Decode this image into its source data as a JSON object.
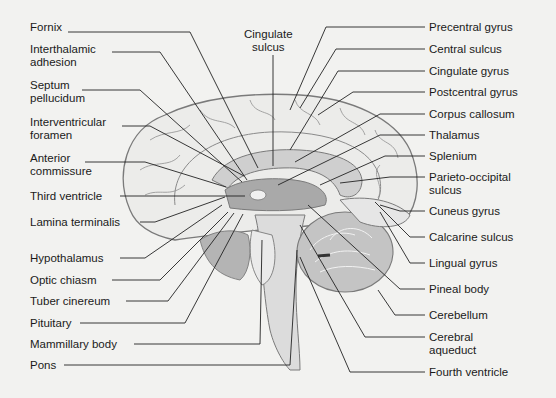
{
  "labels_left": [
    {
      "id": "fornix",
      "text": "Fornix",
      "x": 30,
      "y": 27
    },
    {
      "id": "interthalamic-adhesion",
      "text": "Interthalamic\nadhesion",
      "x": 30,
      "y": 49
    },
    {
      "id": "septum-pellucidum",
      "text": "Septum\npellucidum",
      "x": 30,
      "y": 85
    },
    {
      "id": "interventricular-foramen",
      "text": "Interventricular\nforamen",
      "x": 30,
      "y": 122
    },
    {
      "id": "anterior-commissure",
      "text": "Anterior\ncommissure",
      "x": 30,
      "y": 158
    },
    {
      "id": "third-ventricle",
      "text": "Third ventricle",
      "x": 30,
      "y": 191
    },
    {
      "id": "lamina-terminalis",
      "text": "Lamina terminalis",
      "x": 30,
      "y": 216
    },
    {
      "id": "hypothalamus",
      "text": "Hypothalamus",
      "x": 30,
      "y": 253
    },
    {
      "id": "optic-chiasm",
      "text": "Optic chiasm",
      "x": 30,
      "y": 274
    },
    {
      "id": "tuber-cinereum",
      "text": "Tuber cinereum",
      "x": 30,
      "y": 295
    },
    {
      "id": "pituitary",
      "text": "Pituitary",
      "x": 30,
      "y": 317
    },
    {
      "id": "mammillary-body",
      "text": "Mammillary body",
      "x": 30,
      "y": 338
    },
    {
      "id": "pons",
      "text": "Pons",
      "x": 30,
      "y": 359
    }
  ],
  "labels_top": [
    {
      "id": "cingulate-sulcus",
      "text": "Cingulate\nsulcus",
      "x": 244,
      "y": 28
    }
  ],
  "labels_right": [
    {
      "id": "precentral-gyrus",
      "text": "Precentral gyrus",
      "x": 429,
      "y": 21
    },
    {
      "id": "central-sulcus",
      "text": "Central sulcus",
      "x": 429,
      "y": 43
    },
    {
      "id": "cingulate-gyrus",
      "text": "Cingulate gyrus",
      "x": 429,
      "y": 65
    },
    {
      "id": "postcentral-gyrus",
      "text": "Postcentral gyrus",
      "x": 429,
      "y": 86
    },
    {
      "id": "corpus-callosum",
      "text": "Corpus callosum",
      "x": 429,
      "y": 108
    },
    {
      "id": "thalamus",
      "text": "Thalamus",
      "x": 429,
      "y": 129
    },
    {
      "id": "splenium",
      "text": "Splenium",
      "x": 429,
      "y": 150
    },
    {
      "id": "parieto-occipital-sulcus",
      "text": "Parieto-occipital\nsulcus",
      "x": 429,
      "y": 171
    },
    {
      "id": "cuneus-gyrus",
      "text": "Cuneus gyrus",
      "x": 429,
      "y": 205
    },
    {
      "id": "calcarine-sulcus",
      "text": "Calcarine sulcus",
      "x": 429,
      "y": 231
    },
    {
      "id": "lingual-gyrus",
      "text": "Lingual gyrus",
      "x": 429,
      "y": 257
    },
    {
      "id": "pineal-body",
      "text": "Pineal body",
      "x": 429,
      "y": 283
    },
    {
      "id": "cerebellum",
      "text": "Cerebellum",
      "x": 429,
      "y": 309
    },
    {
      "id": "cerebral-aqueduct",
      "text": "Cerebral\naqueduct",
      "x": 429,
      "y": 331
    },
    {
      "id": "fourth-ventricle",
      "text": "Fourth ventricle",
      "x": 429,
      "y": 366
    }
  ],
  "colors": {
    "background": "#f2f2f0",
    "line": "#222222",
    "outline": "#777777",
    "fill_light": "#e8e8e8",
    "fill_mid": "#bdbdbd",
    "fill_dark": "#8a8a8a"
  }
}
